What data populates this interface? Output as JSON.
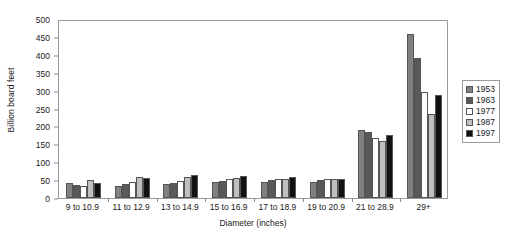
{
  "chart_data": {
    "type": "bar",
    "title": "",
    "subtitle": "",
    "xlabel": "Diameter (inches)",
    "ylabel": "Billion board feet",
    "categories": [
      "9 to 10.9",
      "11 to 12.9",
      "13 to 14.9",
      "15 to 16.9",
      "17 to 18.9",
      "19 to 20.9",
      "21 to 28.9",
      "29+"
    ],
    "series": [
      {
        "name": "1953",
        "color": "#808080",
        "values": [
          42,
          34,
          38,
          45,
          45,
          46,
          190,
          458
        ]
      },
      {
        "name": "1963",
        "color": "#595959",
        "values": [
          37,
          39,
          42,
          48,
          51,
          50,
          184,
          392
        ]
      },
      {
        "name": "1977",
        "color": "#ffffff",
        "values": [
          34,
          44,
          47,
          52,
          54,
          52,
          168,
          297
        ]
      },
      {
        "name": "1987",
        "color": "#bfbfbf",
        "values": [
          50,
          58,
          60,
          57,
          53,
          54,
          158,
          235
        ]
      },
      {
        "name": "1997",
        "color": "#111111",
        "values": [
          42,
          56,
          63,
          62,
          60,
          52,
          175,
          288
        ]
      }
    ],
    "ylim": [
      0,
      500
    ],
    "yticks": [
      0,
      50,
      100,
      150,
      200,
      250,
      300,
      350,
      400,
      450,
      500
    ],
    "ytick_labels": [
      "0",
      "50",
      "100",
      "150",
      "200",
      "250",
      "300",
      "350",
      "400",
      "450",
      "500"
    ],
    "grid": false,
    "legend_position": "right",
    "legend_entries": [
      "1953",
      "1963",
      "1977",
      "1987",
      "1997"
    ]
  }
}
